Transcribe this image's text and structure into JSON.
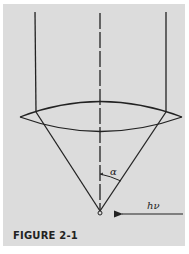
{
  "figure": {
    "caption": "FIGURE 2-1",
    "labels": {
      "angle": "α",
      "photon": "hν"
    },
    "colors": {
      "background": "#dcdcdc",
      "page": "#ffffff",
      "ink": "#222222"
    },
    "elements": [
      "parallel-beam-lines",
      "optical-axis-dashed-line",
      "convex-lens",
      "focusing-cone",
      "focal-point",
      "half-angle-arc",
      "incident-photon-arrow"
    ]
  }
}
